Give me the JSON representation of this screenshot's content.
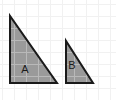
{
  "figure": {
    "canvas": {
      "width": 116,
      "height": 100
    },
    "background": {
      "color": "#ffffff",
      "grid": {
        "visible": true,
        "spacing": 12,
        "line_color": "#f0f0f0",
        "offset_x": 2,
        "offset_y": 4
      }
    },
    "style": {
      "fill_color": "#9a9a9a",
      "outline_color": "#1a1a1a",
      "outline_width": 2,
      "inner_grid_color": "#b8b8b8",
      "label_color": "#1a1a1a"
    },
    "shapes": [
      {
        "name": "triangle-a",
        "label": "A",
        "kind": "right-triangle",
        "points": "10,16 10,83 57,83",
        "vertices": {
          "apex": [
            10,
            16
          ],
          "bottom_left": [
            10,
            83
          ],
          "bottom_right": [
            57,
            83
          ]
        },
        "legs": {
          "vertical": 67,
          "horizontal": 47
        },
        "label_position": [
          25,
          70
        ]
      },
      {
        "name": "triangle-b",
        "label": "B",
        "kind": "right-triangle",
        "points": "66,41 66,83 93,83",
        "vertices": {
          "apex": [
            66,
            41
          ],
          "bottom_left": [
            66,
            83
          ],
          "bottom_right": [
            93,
            83
          ]
        },
        "legs": {
          "vertical": 42,
          "horizontal": 27
        },
        "label_position": [
          72,
          66
        ]
      }
    ]
  }
}
